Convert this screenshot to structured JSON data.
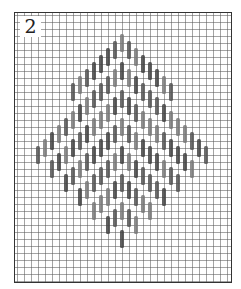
{
  "figure": {
    "label": "2",
    "type": "stitch-chart"
  },
  "grid": {
    "cell_size_px": 7,
    "line_color": "#5a5a5a",
    "frame_color": "#333333"
  },
  "pattern": {
    "shape": "diamond",
    "center_x": 122,
    "top_y": 38,
    "bottom_y": 252,
    "half_width": 98,
    "stitch_length_px": 18,
    "stitch_width_px": 4,
    "column_step_px": 7,
    "row_step_px": 7,
    "chevron_spacing_px": 28,
    "colors": [
      "#555555",
      "#7a7a7a",
      "#444444"
    ]
  }
}
